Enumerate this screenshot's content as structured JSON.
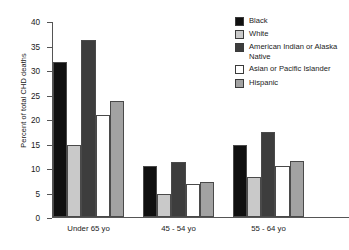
{
  "chart_data": {
    "type": "bar",
    "title": "",
    "xlabel": "",
    "ylabel": "Percent of total CHD deaths",
    "ylim": [
      0,
      40
    ],
    "ytick_step": 5,
    "yticks": [
      40,
      35,
      30,
      25,
      20,
      15,
      10,
      5,
      0
    ],
    "grid": false,
    "legend_position": "right",
    "categories": [
      "Under 65 yo",
      "45 - 54 yo",
      "55 - 64 yo"
    ],
    "series": [
      {
        "name": "Black",
        "color": "#101010",
        "values": [
          31.6,
          10.4,
          14.7
        ]
      },
      {
        "name": "White",
        "color": "#c9c9c9",
        "values": [
          14.7,
          4.6,
          8.1
        ]
      },
      {
        "name": "American Indian or Alaska Native",
        "color": "#3d3d3d",
        "values": [
          36.0,
          11.2,
          17.3
        ]
      },
      {
        "name": "Asian or Pacific Islander",
        "color": "#ffffff",
        "values": [
          20.8,
          6.7,
          10.4
        ]
      },
      {
        "name": "Hispanic",
        "color": "#a2a2a2",
        "values": [
          23.6,
          7.1,
          11.3
        ]
      }
    ]
  }
}
